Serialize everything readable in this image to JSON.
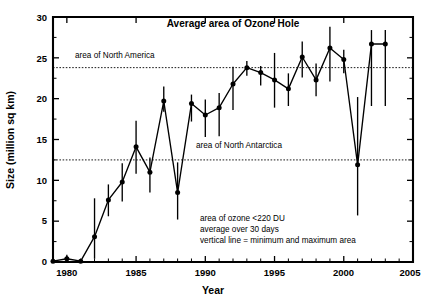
{
  "chart_data": {
    "type": "line",
    "title": "Average area of Ozone Hole",
    "xlabel": "Year",
    "ylabel": "Size (million sq km)",
    "xlim": [
      1979,
      2005
    ],
    "ylim": [
      0,
      30
    ],
    "xticks": [
      1980,
      1985,
      1990,
      1995,
      2000,
      2005
    ],
    "yticks": [
      0,
      5,
      10,
      15,
      20,
      25,
      30
    ],
    "grid": false,
    "legend": "none",
    "x": [
      1979,
      1980,
      1981,
      1982,
      1983,
      1984,
      1985,
      1986,
      1987,
      1988,
      1989,
      1990,
      1991,
      1992,
      1993,
      1994,
      1995,
      1996,
      1997,
      1998,
      1999,
      2000,
      2001,
      2002,
      2003
    ],
    "values": [
      0.1,
      0.4,
      0.1,
      3.1,
      7.6,
      9.8,
      14.1,
      11.0,
      19.7,
      8.5,
      19.4,
      18.0,
      18.9,
      21.8,
      23.8,
      23.2,
      22.3,
      21.2,
      25.1,
      22.3,
      26.2,
      24.8,
      11.9,
      26.7,
      26.7
    ],
    "err_low": [
      0.0,
      0.0,
      0.0,
      0.4,
      5.6,
      7.4,
      10.8,
      8.5,
      18.4,
      5.2,
      17.2,
      15.3,
      15.4,
      18.6,
      22.8,
      21.6,
      18.9,
      19.1,
      22.6,
      20.3,
      22.1,
      23.1,
      5.7,
      19.1,
      19.1
    ],
    "err_high": [
      0.2,
      0.9,
      0.2,
      7.8,
      9.5,
      12.1,
      17.3,
      12.8,
      21.5,
      12.2,
      20.5,
      19.9,
      20.7,
      23.9,
      24.6,
      24.0,
      25.6,
      23.1,
      27.0,
      24.3,
      28.8,
      26.0,
      20.2,
      28.4,
      28.4
    ],
    "series": [
      {
        "name": "Average area of ozone hole",
        "points": [
          {
            "year": 1979,
            "avg": 0.1,
            "min": 0.0,
            "max": 0.2
          },
          {
            "year": 1980,
            "avg": 0.4,
            "min": 0.0,
            "max": 0.9
          },
          {
            "year": 1981,
            "avg": 0.1,
            "min": 0.0,
            "max": 0.2
          },
          {
            "year": 1982,
            "avg": 3.1,
            "min": 0.4,
            "max": 7.8
          },
          {
            "year": 1983,
            "avg": 7.6,
            "min": 5.6,
            "max": 9.5
          },
          {
            "year": 1984,
            "avg": 9.8,
            "min": 7.4,
            "max": 12.1
          },
          {
            "year": 1985,
            "avg": 14.1,
            "min": 10.8,
            "max": 17.3
          },
          {
            "year": 1986,
            "avg": 11.0,
            "min": 8.5,
            "max": 12.8
          },
          {
            "year": 1987,
            "avg": 19.7,
            "min": 18.4,
            "max": 21.5
          },
          {
            "year": 1988,
            "avg": 8.5,
            "min": 5.2,
            "max": 12.2
          },
          {
            "year": 1989,
            "avg": 19.4,
            "min": 17.2,
            "max": 20.5
          },
          {
            "year": 1990,
            "avg": 18.0,
            "min": 15.3,
            "max": 19.9
          },
          {
            "year": 1991,
            "avg": 18.9,
            "min": 15.4,
            "max": 20.7
          },
          {
            "year": 1992,
            "avg": 21.8,
            "min": 18.6,
            "max": 23.9
          },
          {
            "year": 1993,
            "avg": 23.8,
            "min": 22.8,
            "max": 24.6
          },
          {
            "year": 1994,
            "avg": 23.2,
            "min": 21.6,
            "max": 24.0
          },
          {
            "year": 1995,
            "avg": 22.3,
            "min": 18.9,
            "max": 25.6
          },
          {
            "year": 1996,
            "avg": 21.2,
            "min": 19.1,
            "max": 23.1
          },
          {
            "year": 1997,
            "avg": 25.1,
            "min": 22.6,
            "max": 27.0
          },
          {
            "year": 1998,
            "avg": 22.3,
            "min": 20.3,
            "max": 24.3
          },
          {
            "year": 1999,
            "avg": 26.2,
            "min": 22.1,
            "max": 28.8
          },
          {
            "year": 2000,
            "avg": 24.8,
            "min": 23.1,
            "max": 26.0
          },
          {
            "year": 2001,
            "avg": 11.9,
            "min": 5.7,
            "max": 20.2
          },
          {
            "year": 2002,
            "avg": 26.7,
            "min": 19.1,
            "max": 28.4
          }
        ]
      }
    ],
    "reference_lines": [
      {
        "label": "area of North America",
        "value": 23.8
      },
      {
        "label": "area of North Antarctica",
        "value": 12.5
      }
    ],
    "annotations": [
      "area of ozone <220 DU",
      "average over 30 days",
      "vertical line = minimum and maximum area"
    ]
  },
  "axis": {
    "ytick_0": "0",
    "ytick_1": "5",
    "ytick_2": "10",
    "ytick_3": "15",
    "ytick_4": "20",
    "ytick_5": "25",
    "ytick_6": "30",
    "xtick_0": "1980",
    "xtick_1": "1985",
    "xtick_2": "1990",
    "xtick_3": "1995",
    "xtick_4": "2000",
    "xtick_5": "2005"
  },
  "refs": {
    "north_america": "area of North America",
    "north_antarctica": "area of North Antarctica"
  },
  "notes": {
    "line1": "area of ozone <220 DU",
    "line2": "average over 30 days",
    "line3": "vertical line = minimum and maximum area"
  },
  "colors": {
    "ink": "#000000",
    "background": "#ffffff"
  }
}
